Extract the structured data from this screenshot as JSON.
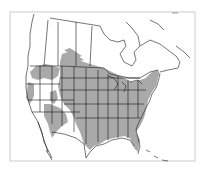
{
  "map": {
    "type": "species-range-map",
    "region": "North America",
    "colors": {
      "background": "#ffffff",
      "range_fill": "#a9a9a9",
      "boundary_stroke": "#1a1a1a",
      "frame_stroke": "#bdbdbd"
    },
    "frame": {
      "x": 10,
      "y": 12,
      "width": 185,
      "height": 149
    },
    "layers": [
      "frame",
      "range-shading",
      "coastlines",
      "state-province-boundaries"
    ],
    "range_description": "Shaded range covering eastern and central United States, Great Plains, parts of the Intermountain West and northwestern states, extending into southern Canadian prairies and southern Ontario/Quebec"
  }
}
